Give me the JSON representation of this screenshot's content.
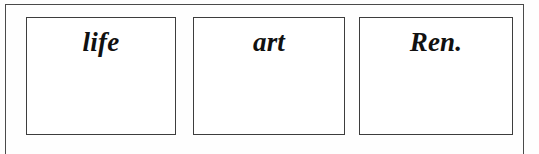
{
  "figure": {
    "background_color": "#fefefe",
    "frame_color": "#4a4a4a",
    "cell_border_color": "#3d3d3d",
    "text_color": "#111111",
    "cells": [
      {
        "label": "life"
      },
      {
        "label": "art"
      },
      {
        "label": "Ren."
      }
    ]
  }
}
